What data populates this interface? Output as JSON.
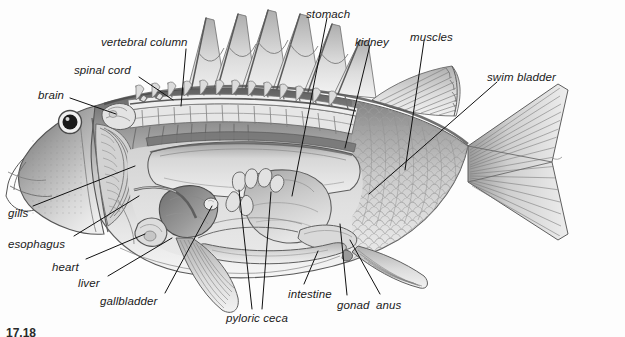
{
  "figure": {
    "number": "17.18",
    "background_color": "#fdfdfd",
    "label_color": "#1a1a1a",
    "leader_color": "#111111"
  },
  "labels": [
    {
      "id": "vertebral-column",
      "text": "vertebral column",
      "x": 101,
      "y": 37,
      "leader": [
        [
          186,
          49
        ],
        [
          181,
          106
        ]
      ]
    },
    {
      "id": "spinal-cord",
      "text": "spinal cord",
      "x": 74,
      "y": 65,
      "leader": [
        [
          139,
          77
        ],
        [
          173,
          100
        ]
      ]
    },
    {
      "id": "brain",
      "text": "brain",
      "x": 38,
      "y": 90,
      "leader": [
        [
          70,
          98
        ],
        [
          116,
          114
        ]
      ]
    },
    {
      "id": "stomach",
      "text": "stomach",
      "x": 306,
      "y": 9,
      "leader": [
        [
          327,
          18
        ],
        [
          292,
          196
        ]
      ]
    },
    {
      "id": "kidney",
      "text": "kidney",
      "x": 355,
      "y": 37,
      "leader": [
        [
          370,
          45
        ],
        [
          345,
          148
        ]
      ]
    },
    {
      "id": "muscles",
      "text": "muscles",
      "x": 410,
      "y": 32,
      "leader": [
        [
          424,
          41
        ],
        [
          405,
          170
        ]
      ]
    },
    {
      "id": "swim-bladder",
      "text": "swim bladder",
      "x": 487,
      "y": 72,
      "leader": [
        [
          497,
          82
        ],
        [
          369,
          194
        ]
      ]
    },
    {
      "id": "gills",
      "text": "gills",
      "x": 8,
      "y": 208,
      "leader": [
        [
          33,
          206
        ],
        [
          135,
          166
        ]
      ]
    },
    {
      "id": "esophagus",
      "text": "esophagus",
      "x": 8,
      "y": 239,
      "leader": [
        [
          74,
          236
        ],
        [
          139,
          196
        ]
      ]
    },
    {
      "id": "heart",
      "text": "heart",
      "x": 52,
      "y": 262,
      "leader": [
        [
          86,
          259
        ],
        [
          145,
          234
        ]
      ]
    },
    {
      "id": "liver",
      "text": "liver",
      "x": 78,
      "y": 278,
      "leader": [
        [
          108,
          276
        ],
        [
          172,
          238
        ]
      ]
    },
    {
      "id": "gallbladder",
      "text": "gallbladder",
      "x": 100,
      "y": 296,
      "leader": [
        [
          165,
          293
        ],
        [
          212,
          206
        ]
      ]
    },
    {
      "id": "pyloric-ceca",
      "text": "pyloric ceca",
      "x": 226,
      "y": 313,
      "leader": [
        [
          252,
          309
        ],
        [
          239,
          190
        ]
      ],
      "leader2": [
        [
          262,
          309
        ],
        [
          271,
          192
        ]
      ]
    },
    {
      "id": "intestine",
      "text": "intestine",
      "x": 288,
      "y": 289,
      "leader": [
        [
          304,
          284
        ],
        [
          318,
          251
        ]
      ]
    },
    {
      "id": "gonad",
      "text": "gonad",
      "x": 337,
      "y": 300,
      "leader": [
        [
          347,
          295
        ],
        [
          340,
          224
        ]
      ]
    },
    {
      "id": "anus",
      "text": "anus",
      "x": 376,
      "y": 300,
      "leader": [
        [
          380,
          294
        ],
        [
          350,
          240
        ]
      ]
    }
  ]
}
